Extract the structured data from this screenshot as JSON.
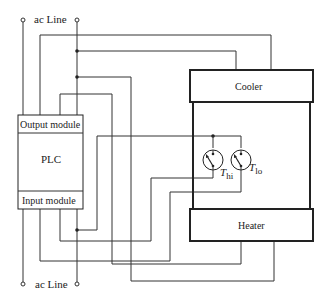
{
  "diagram": {
    "ac_line_top": "ac Line",
    "ac_line_bottom": "ac Line",
    "plc": {
      "output_module": "Output module",
      "label": "PLC",
      "input_module": "Input module"
    },
    "cooler": "Cooler",
    "heater": "Heater",
    "thermostats": {
      "hi": {
        "symbol": "T",
        "subscript": "hi"
      },
      "lo": {
        "symbol": "T",
        "subscript": "lo"
      }
    }
  }
}
